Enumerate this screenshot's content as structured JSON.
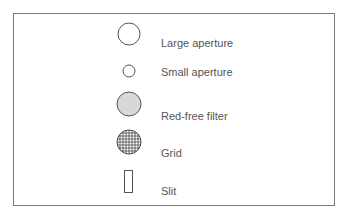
{
  "legend": {
    "items": [
      {
        "icon": "large-circle",
        "label": "Large aperture"
      },
      {
        "icon": "small-circle",
        "label": "Small aperture"
      },
      {
        "icon": "filled-circle",
        "label": "Red-free filter"
      },
      {
        "icon": "grid-circle",
        "label": "Grid"
      },
      {
        "icon": "rectangle",
        "label": "Slit"
      }
    ]
  },
  "colors": {
    "stroke": "#555555",
    "fill_gray": "#d8d8d8",
    "border": "#7a7a7a",
    "text": "#555555"
  }
}
